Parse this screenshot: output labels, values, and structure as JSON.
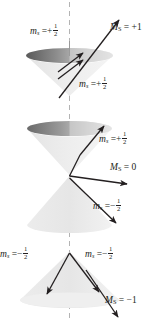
{
  "figure": {
    "name": "spin-vector-model-triplet-cones",
    "axis_label": "z",
    "colors": {
      "text": "#231f20",
      "vector": "#231f20",
      "cone_light": "#e9e9e9",
      "cone_dark": "#6e6e6e",
      "axis_dash": "#b0b0b0"
    }
  },
  "labels": {
    "top_ms_upper": {
      "symbol": "m",
      "sub": "s",
      "eq": "=",
      "sign": "+",
      "num": "1",
      "den": "2"
    },
    "top_Ms": {
      "symbol": "M",
      "sub": "S",
      "eq": "=",
      "value": "+1"
    },
    "top_ms_lower": {
      "symbol": "m",
      "sub": "s",
      "eq": "=",
      "sign": "+",
      "num": "1",
      "den": "2"
    },
    "mid_ms_upper": {
      "symbol": "m",
      "sub": "s",
      "eq": "=",
      "sign": "+",
      "num": "1",
      "den": "2"
    },
    "mid_Ms": {
      "symbol": "M",
      "sub": "S",
      "eq": "=",
      "value": "0"
    },
    "mid_ms_lower": {
      "symbol": "m",
      "sub": "s",
      "eq": "=",
      "sign": "−",
      "num": "1",
      "den": "2"
    },
    "bot_ms_left": {
      "symbol": "m",
      "sub": "s",
      "eq": "=",
      "sign": "−",
      "num": "1",
      "den": "2"
    },
    "bot_ms_right": {
      "symbol": "m",
      "sub": "s",
      "eq": "=",
      "sign": "−",
      "num": "1",
      "den": "2"
    },
    "bot_Ms": {
      "symbol": "M",
      "sub": "S",
      "eq": "=",
      "value": "−1"
    }
  },
  "panels": [
    {
      "name": "panel-ms-plus-1",
      "total": "+1",
      "components": [
        "+1/2",
        "+1/2"
      ]
    },
    {
      "name": "panel-ms-zero",
      "total": "0",
      "components": [
        "+1/2",
        "-1/2"
      ]
    },
    {
      "name": "panel-ms-minus-1",
      "total": "-1",
      "components": [
        "-1/2",
        "-1/2"
      ]
    }
  ]
}
